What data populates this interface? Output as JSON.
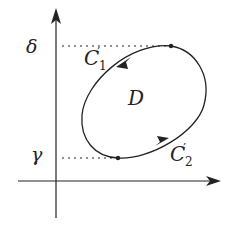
{
  "diagram": {
    "type": "region-boundary-sketch",
    "colors": {
      "stroke": "#222222",
      "background": "#ffffff"
    },
    "axes": {
      "y_axis": {
        "direction": "up",
        "has_arrow": true
      },
      "x_axis": {
        "direction": "right",
        "has_arrow": true
      }
    },
    "y_levels": [
      {
        "symbol": "δ",
        "role": "upper bound",
        "dotted_guide": true
      },
      {
        "symbol": "γ",
        "role": "lower bound",
        "dotted_guide": true
      }
    ],
    "region": {
      "label": "D"
    },
    "curves": [
      {
        "name": "C",
        "subscript": "1",
        "prime": "′",
        "orientation": "counterclockwise (upper-left arc, arrow pointing down-left)"
      },
      {
        "name": "C",
        "subscript": "2",
        "prime": "′",
        "orientation": "counterclockwise (lower-right arc, arrow pointing up-right)"
      }
    ],
    "points": [
      {
        "description": "top touch point at y = δ"
      },
      {
        "description": "bottom touch point at y = γ"
      }
    ]
  }
}
